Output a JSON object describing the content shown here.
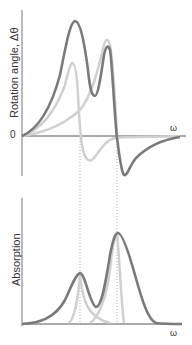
{
  "top_plot": {
    "ylabel": "Rotation angle, Δθ",
    "zero_label": "0",
    "xlabel": "ω"
  },
  "bottom_plot": {
    "ylabel": "Absorption",
    "xlabel": "ω"
  },
  "colors": {
    "total_curve": "#7a7a7a",
    "component_curve": "#cfcfcf",
    "axis": "#666666",
    "dotted_guides": "#888888"
  }
}
